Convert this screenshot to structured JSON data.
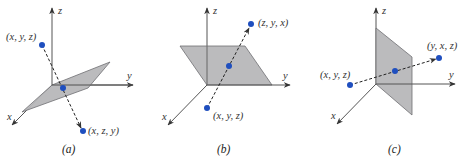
{
  "figure": {
    "colors": {
      "point": "#1f4fbf",
      "plane": "#b7b7b9",
      "axis": "#555555"
    },
    "panels": [
      {
        "id": "a",
        "caption": "(a)",
        "axes": {
          "x": "x",
          "y": "y",
          "z": "z"
        },
        "points": {
          "start": "(x, y, z)",
          "reflected": "(x, z, y)"
        },
        "plane": "y = z"
      },
      {
        "id": "b",
        "caption": "(b)",
        "axes": {
          "x": "x",
          "y": "y",
          "z": "z"
        },
        "points": {
          "start": "(x, y, z)",
          "reflected": "(z, y, x)"
        },
        "plane": "x = z"
      },
      {
        "id": "c",
        "caption": "(c)",
        "axes": {
          "x": "x",
          "y": "y",
          "z": "z"
        },
        "points": {
          "start": "(x, y, z)",
          "reflected": "(y, x, z)"
        },
        "plane": "x = y"
      }
    ]
  }
}
